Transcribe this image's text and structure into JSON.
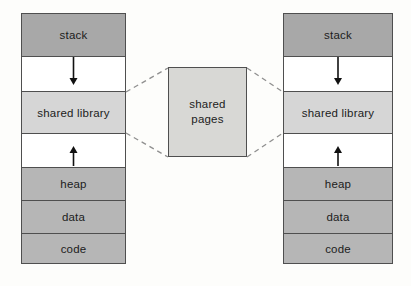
{
  "diagram": {
    "segments": {
      "stack": "stack",
      "shared_library": "shared library",
      "heap": "heap",
      "data": "data",
      "code": "code"
    },
    "shared_pages": {
      "line1": "shared",
      "line2": "pages"
    },
    "colors": {
      "stack_fill": "#a8a8a8",
      "segment_fill": "#b6b6b6",
      "shared_library_fill": "#d6d6d6",
      "shared_pages_fill": "#d8d8d5",
      "border": "#4f4f4f",
      "dashed_connector": "#8f8f8f",
      "arrow": "#111111",
      "background": "#fdfdfb"
    }
  }
}
